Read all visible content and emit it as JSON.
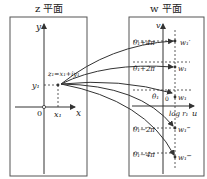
{
  "z_plane": {
    "title": "z 平面",
    "axis_x": "x",
    "axis_y": "y",
    "origin": "0",
    "point_label": "z₁=x₁+iy₁",
    "x1_label": "x₁",
    "y1_label": "y₁"
  },
  "w_plane": {
    "title": "w 平面",
    "axis_u": "u",
    "axis_v": "v",
    "origin": "0",
    "logr_label": "log r₁",
    "levels": [
      {
        "label": "θ₁+4π",
        "point": "w₁′"
      },
      {
        "label": "θ₁+2π",
        "point": "w₁"
      },
      {
        "label": "θ₁",
        "point": "w₁"
      },
      {
        "label": "θ₁−2π",
        "point": "w₁‴"
      },
      {
        "label": "θ₁−4π",
        "point": "w₁⁗"
      }
    ]
  },
  "colors": {
    "line": "#333333",
    "frame": "#555555"
  }
}
